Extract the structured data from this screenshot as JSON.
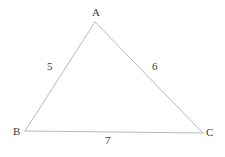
{
  "figure": {
    "kind": "triangle-diagram",
    "background_color": "#ffffff",
    "line_color": "#b9b9b9",
    "line_width": 1,
    "text_color": "#3a3a3a",
    "vertices": [
      {
        "name": "A",
        "label": "A",
        "x": 95,
        "y": 22,
        "label_x": 96,
        "label_y": 12
      },
      {
        "name": "B",
        "label": "B",
        "x": 25,
        "y": 131,
        "label_x": 17,
        "label_y": 132
      },
      {
        "name": "C",
        "label": "C",
        "x": 203,
        "y": 133,
        "label_x": 210,
        "label_y": 133
      }
    ],
    "sides": [
      {
        "name": "AB",
        "from": "A",
        "to": "B",
        "label": "5",
        "label_x": 51,
        "label_y": 67
      },
      {
        "name": "AC",
        "from": "A",
        "to": "C",
        "label": "6",
        "label_x": 156,
        "label_y": 67
      },
      {
        "name": "BC",
        "from": "B",
        "to": "C",
        "label": "7",
        "label_x": 109,
        "label_y": 141
      }
    ]
  },
  "chart_data": {
    "type": "diagram",
    "title": "",
    "subtitle": "",
    "xlabel": "",
    "ylabel": "",
    "categories": [
      "AB",
      "AC",
      "BC"
    ],
    "values": [
      5,
      6,
      7
    ],
    "point_labels": [
      "A",
      "B",
      "C"
    ],
    "annotations": [
      "5",
      "6",
      "7"
    ],
    "legend": [],
    "grid": false
  }
}
